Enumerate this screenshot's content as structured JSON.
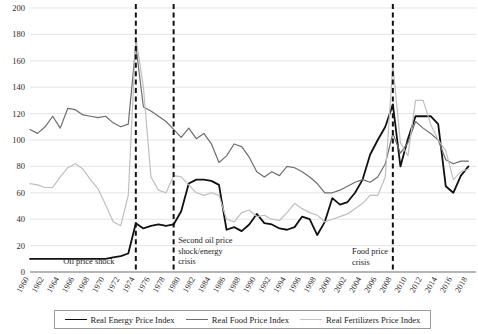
{
  "chart_data": {
    "type": "line",
    "title": "",
    "xlabel": "",
    "ylabel": "",
    "xlim": [
      1960,
      2019
    ],
    "ylim": [
      0,
      200
    ],
    "ytick_step": 20,
    "yticks": [
      0,
      20,
      40,
      60,
      80,
      100,
      120,
      140,
      160,
      180,
      200
    ],
    "xticks": [
      1960,
      1962,
      1964,
      1966,
      1968,
      1970,
      1972,
      1974,
      1976,
      1978,
      1980,
      1982,
      1984,
      1986,
      1988,
      1990,
      1992,
      1994,
      1996,
      1998,
      2000,
      2002,
      2004,
      2006,
      2008,
      2010,
      2012,
      2014,
      2016,
      2018
    ],
    "grid": "horizontal",
    "legend_position": "bottom",
    "x": [
      1960,
      1961,
      1962,
      1963,
      1964,
      1965,
      1966,
      1967,
      1968,
      1969,
      1970,
      1971,
      1972,
      1973,
      1974,
      1975,
      1976,
      1977,
      1978,
      1979,
      1980,
      1981,
      1982,
      1983,
      1984,
      1985,
      1986,
      1987,
      1988,
      1989,
      1990,
      1991,
      1992,
      1993,
      1994,
      1995,
      1996,
      1997,
      1998,
      1999,
      2000,
      2001,
      2002,
      2003,
      2004,
      2005,
      2006,
      2007,
      2008,
      2009,
      2010,
      2011,
      2012,
      2013,
      2014,
      2015,
      2016,
      2017,
      2018
    ],
    "series": [
      {
        "name": "Real Energy Price Index",
        "color": "#111111",
        "width": 1.8,
        "values": [
          10,
          10,
          10,
          10,
          10,
          10,
          10,
          10,
          10,
          10,
          10,
          11,
          12,
          14,
          37,
          33,
          35,
          36,
          35,
          36,
          46,
          67,
          70,
          70,
          69,
          66,
          32,
          34,
          31,
          36,
          44,
          37,
          36,
          33,
          32,
          34,
          42,
          40,
          28,
          38,
          56,
          51,
          53,
          60,
          70,
          89,
          100,
          110,
          127,
          80,
          101,
          118,
          118,
          118,
          112,
          65,
          60,
          73,
          80
        ]
      },
      {
        "name": "Real Food Price Index",
        "color": "#6e6e6e",
        "width": 1.2,
        "values": [
          108,
          105,
          110,
          118,
          109,
          124,
          123,
          119,
          118,
          117,
          118,
          113,
          110,
          112,
          172,
          125,
          122,
          118,
          114,
          108,
          102,
          109,
          101,
          105,
          97,
          83,
          88,
          97,
          95,
          87,
          76,
          72,
          76,
          73,
          80,
          79,
          76,
          72,
          67,
          60,
          60,
          62,
          65,
          68,
          70,
          68,
          72,
          82,
          105,
          90,
          98,
          114,
          109,
          105,
          100,
          85,
          82,
          84,
          84
        ]
      },
      {
        "name": "Real Fertilizers Price Index",
        "color": "#bfbfbf",
        "width": 1.2,
        "values": [
          67,
          66,
          64,
          64,
          72,
          79,
          82,
          78,
          70,
          63,
          51,
          38,
          35,
          58,
          178,
          140,
          72,
          62,
          60,
          73,
          72,
          66,
          60,
          58,
          60,
          58,
          40,
          38,
          45,
          47,
          42,
          43,
          40,
          39,
          45,
          52,
          48,
          45,
          43,
          38,
          40,
          42,
          44,
          48,
          52,
          58,
          58,
          72,
          157,
          98,
          88,
          130,
          130,
          112,
          100,
          92,
          70,
          76,
          78
        ]
      }
    ],
    "event_lines": [
      {
        "year": 1974,
        "label": "Oil price shock",
        "label_anchor": "left"
      },
      {
        "year": 1979,
        "label": "Second oil price shock/energy crisis",
        "label_anchor": "right"
      },
      {
        "year": 2008,
        "label": "Food price crisis",
        "label_anchor": "left"
      }
    ],
    "annotations": [
      {
        "name": "oil-price-shock",
        "lines": [
          "Oil price shock"
        ]
      },
      {
        "name": "second-oil-price-shock",
        "lines": [
          "Second oil price",
          "shock/energy",
          "crisis"
        ]
      },
      {
        "name": "food-price-crisis",
        "lines": [
          "Food price",
          "crisis"
        ]
      }
    ]
  },
  "legend": {
    "items": [
      {
        "label": "Real Energy Price Index",
        "color": "#111111",
        "thickness": "1.9px"
      },
      {
        "label": "Real Food Price Index",
        "color": "#6e6e6e",
        "thickness": "1.2px"
      },
      {
        "label": "Real Fertilizers Price Index",
        "color": "#c2c2c2",
        "thickness": "1.2px"
      }
    ]
  }
}
